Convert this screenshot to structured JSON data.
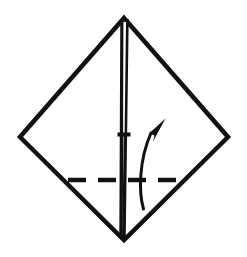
{
  "figure": {
    "canvas": {
      "width": 247,
      "height": 257,
      "background": "#ffffff"
    },
    "colors": {
      "ink": "#111111",
      "paper": "#ffffff",
      "dash": "#111111",
      "arrow": "#111111"
    }
  },
  "shapes": {
    "diamond": {
      "name": "diamond-outline",
      "points": "124,18 228,137 124,240 20,137",
      "stroke_width": 4.5
    },
    "center_crease_left": {
      "name": "center-crease-left-line",
      "x1": 122.0,
      "y1": 19.0,
      "x2": 121.0,
      "y2": 238.0,
      "stroke_width": 3.4
    },
    "center_crease_right": {
      "name": "center-crease-right-line",
      "x1": 127.0,
      "y1": 19.0,
      "x2": 124.0,
      "y2": 238.0,
      "stroke_width": 3.4
    },
    "center_sliver": {
      "name": "center-crease-gap-sliver",
      "points": "123.6,22 126.0,22 124.6,134 123.4,134",
      "fill": "#ffffff"
    },
    "crease_notch": {
      "name": "center-crease-notch-mark",
      "x": 117.5,
      "y": 132.5,
      "width": 13.0,
      "height": 4.0
    },
    "dashed_fold_line": {
      "name": "valley-fold-dashed-line",
      "x1": 68,
      "y1": 180,
      "x2": 184,
      "y2": 180,
      "stroke_width": 4.5,
      "dash_pattern": "18 12"
    },
    "fold_arrow": {
      "name": "fold-direction-arrow",
      "path": "M 143.5 209 C 138.5 192 139.0 160 151.0 133",
      "stroke_width": 3.0,
      "head_points": "165.5,118.5 149.0,133.5 154.5,135.5 153.0,141.5"
    }
  },
  "labels": {
    "diagram_caption": ""
  }
}
